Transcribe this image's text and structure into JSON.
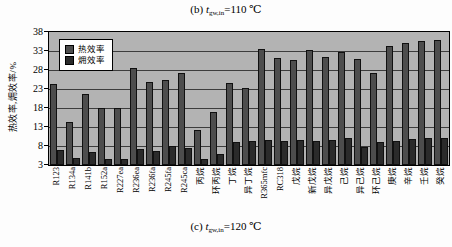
{
  "figure": {
    "title": {
      "prefix": "(b) ",
      "symbol": "t",
      "subscript": "gw,in",
      "suffix": "=110 ℃"
    },
    "caption": {
      "prefix": "(c) ",
      "symbol": "t",
      "subscript": "gw,in",
      "suffix": "=120 ℃"
    }
  },
  "chart_data": {
    "type": "bar",
    "caption": "(c) t_gw,in=120 ℃",
    "ylabel": "热效率,㶲效率/%",
    "ylim": [
      3,
      38
    ],
    "yticks": [
      38,
      33,
      28,
      23,
      18,
      13,
      8,
      3
    ],
    "grid": true,
    "legend_position": "top-left-inside",
    "plot_background": "#b3b3b3",
    "categories": [
      "R123",
      "R134a",
      "R141b",
      "R152a",
      "R227ea",
      "R236ea",
      "R236fa",
      "R245fa",
      "R245ca",
      "丙烷",
      "环丙烷",
      "丁烷",
      "异丁烷",
      "R365mfc",
      "RC318",
      "戊烷",
      "新戊烷",
      "异戊烷",
      "己烷",
      "异己烷",
      "环己烷",
      "庚烷",
      "辛烷",
      "壬烷",
      "癸烷"
    ],
    "series": [
      {
        "name": "热效率",
        "color": "#4d4d4d",
        "values": [
          24.4,
          14.4,
          21.8,
          17.9,
          17.9,
          28.4,
          24.8,
          25.4,
          27.1,
          12.3,
          17.0,
          24.6,
          23.3,
          33.4,
          31.2,
          30.7,
          33.2,
          31.3,
          32.8,
          30.8,
          27.3,
          34.4,
          35.0,
          35.5,
          35.8
        ]
      },
      {
        "name": "㶲效率",
        "color": "#2b2b2b",
        "values": [
          7.0,
          4.9,
          6.4,
          4.7,
          4.7,
          7.1,
          6.7,
          7.9,
          7.6,
          4.6,
          5.8,
          9.0,
          9.3,
          9.7,
          9.3,
          9.5,
          9.3,
          9.7,
          10.0,
          7.8,
          9.0,
          9.4,
          9.8,
          10.0,
          10.2
        ]
      }
    ]
  }
}
